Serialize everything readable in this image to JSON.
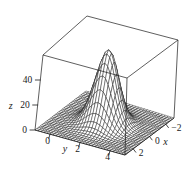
{
  "figure": {
    "aria_label": "3D hidden-line wireframe surface plot of a sharp Gaussian peak inside a box"
  },
  "chart_data": {
    "type": "surface3d",
    "style": "hidden-line wireframe mesh, black lines on white, enclosed in 3D bounding box",
    "title": "",
    "surface": {
      "formula": "z = 58*exp(-((x)^2 + (y-2)^2))",
      "amplitude": 58,
      "center_x": 0,
      "center_y": 2,
      "falloff": 1,
      "peak_z": 58
    },
    "domain": {
      "x_min": -3,
      "x_max": 3,
      "y_min": -1,
      "y_max": 5,
      "z_min": 0,
      "z_max": 60
    },
    "grid": {
      "nx": 30,
      "ny": 30
    },
    "axes": {
      "x": {
        "label": "x",
        "ticks": [
          {
            "label": "2",
            "value": 2
          },
          {
            "label": "0",
            "value": 0
          },
          {
            "label": "−2",
            "value": -2
          }
        ]
      },
      "y": {
        "label": "y",
        "ticks": [
          {
            "label": "0",
            "value": 0
          },
          {
            "label": "2",
            "value": 2
          },
          {
            "label": "4",
            "value": 4
          }
        ]
      },
      "z": {
        "label": "z",
        "ticks": [
          {
            "label": "0",
            "value": 0
          },
          {
            "label": "20",
            "value": 20
          },
          {
            "label": "40",
            "value": 40
          }
        ]
      }
    },
    "colors": {
      "line": "#1a1a1a",
      "box": "#1a1a1a",
      "text": "#1a1a1a",
      "background": "#ffffff",
      "mesh_fill": "#ffffff"
    },
    "view": {
      "corners": {
        "FL": [
          35,
          130
        ],
        "FF": [
          125,
          155
        ],
        "FR": [
          174,
          118
        ],
        "FB": [
          86,
          91
        ],
        "TL": [
          43,
          55
        ],
        "TF": [
          127,
          78
        ],
        "TR": [
          178,
          40
        ],
        "TB": [
          87,
          16
        ]
      }
    }
  }
}
